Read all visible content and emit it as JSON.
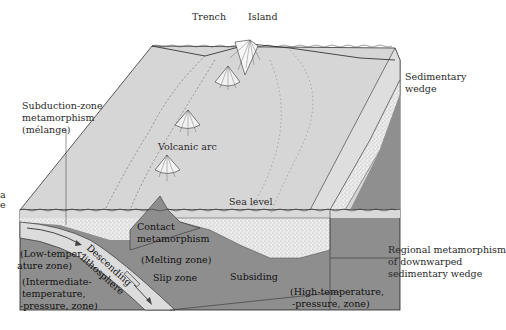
{
  "figure": {
    "type": "block diagram",
    "colors": {
      "background": "#ffffff",
      "ocean_surface": "#d4d4d4",
      "sediment": "#e6e6e6",
      "crust_dark": "#8e8e8e",
      "lithosphere_slab": "#dcdcdc",
      "outline": "#222222"
    }
  },
  "labels": {
    "trench": "Trench",
    "island": "Island",
    "sedimentary_wedge_1": "Sedimentary",
    "sedimentary_wedge_2": "wedge",
    "subduction_1": "Subduction-zone",
    "subduction_2": "metamorphism",
    "subduction_3": "(mélange)",
    "volcanic_arc": "Volcanic arc",
    "sea_level": "Sea level",
    "contact_1": "Contact",
    "contact_2": "metamorphism",
    "melting_zone": "(Melting zone)",
    "low_temp_1": "(Low-temper-",
    "low_temp_2": "ature zone)",
    "descending_1": "Descending",
    "descending_2": "lithosphere",
    "slip_zone": "Slip zone",
    "subsiding": "Subsiding",
    "intermediate_1": "(Intermediate-",
    "intermediate_2": "temperature,",
    "intermediate_3": "-pressure, zone)",
    "regional_1": "Regional metamorphism",
    "regional_2": "of downwarped",
    "regional_3": "sedimentary wedge",
    "high_temp_1": "(High-temperature,",
    "high_temp_2": "-pressure, zone)",
    "edge_fragment_1": "a",
    "edge_fragment_2": "e"
  }
}
